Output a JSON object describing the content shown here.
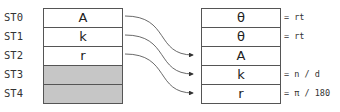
{
  "before": {
    "labels": [
      "ST0",
      "ST1",
      "ST2",
      "ST3",
      "ST4"
    ],
    "cells": [
      "A",
      "k",
      "r",
      "",
      ""
    ]
  },
  "after": {
    "cells": [
      "θ",
      "θ",
      "A",
      "k",
      "r"
    ],
    "notes": [
      "= rt",
      "= rt",
      "",
      "= n / d",
      "= π / 180"
    ]
  },
  "arrows": [
    {
      "from": "ST0",
      "to": "ST2"
    },
    {
      "from": "ST1",
      "to": "ST3"
    },
    {
      "from": "ST2",
      "to": "ST4"
    }
  ],
  "colors": {
    "border": "#555555",
    "empty_fill": "#c6c6c6",
    "arrow": "#333333"
  }
}
